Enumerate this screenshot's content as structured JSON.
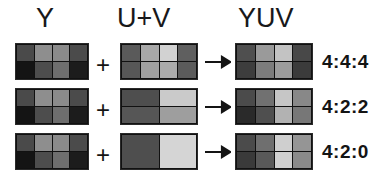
{
  "diagram": {
    "title_columns": {
      "luma": "Y",
      "chroma": "U+V",
      "combined": "YUV"
    },
    "operators": {
      "plus": "+",
      "arrow": "arrow-right-icon"
    },
    "rows": [
      {
        "ratio_label": "4:4:4",
        "luma": {
          "name": "luma-grid",
          "cols": 4,
          "rows": 2,
          "cells": [
            "#4a4a4a",
            "#8e8e8e",
            "#8b8b8b",
            "#4b4b4b",
            "#141414",
            "#4d4d4d",
            "#6e6e6e",
            "#1c1c1c"
          ]
        },
        "chroma": {
          "name": "chroma-grid",
          "cols": 4,
          "rows": 2,
          "cells": [
            "#5a5a5a",
            "#a8a8a8",
            "#d2d2d2",
            "#5f5f5f",
            "#575757",
            "#a0a0a0",
            "#ababab",
            "#5b5b5b"
          ]
        },
        "output": {
          "name": "yuv-grid",
          "cols": 4,
          "rows": 2,
          "cells": [
            "#4f4f4f",
            "#9a9a9a",
            "#c3c3c3",
            "#484848",
            "#3d3d3d",
            "#7c7c7c",
            "#9c9c9c",
            "#3b3b3b"
          ]
        }
      },
      {
        "ratio_label": "4:2:2",
        "luma": {
          "name": "luma-grid",
          "cols": 4,
          "rows": 2,
          "cells": [
            "#4a4a4a",
            "#8e8e8e",
            "#8b8b8b",
            "#4b4b4b",
            "#141414",
            "#4d4d4d",
            "#6e6e6e",
            "#1c1c1c"
          ]
        },
        "chroma": {
          "name": "chroma-grid",
          "cols": 2,
          "rows": 2,
          "cells": [
            "#4e4e4e",
            "#cacaca",
            "#565656",
            "#9e9e9e"
          ]
        },
        "output": {
          "name": "yuv-grid",
          "cols": 4,
          "rows": 2,
          "cells": [
            "#4b4b4b",
            "#717171",
            "#c6c6c6",
            "#888888",
            "#2a2a2a",
            "#4f4f4f",
            "#b2b2b2",
            "#777777"
          ]
        }
      },
      {
        "ratio_label": "4:2:0",
        "luma": {
          "name": "luma-grid",
          "cols": 4,
          "rows": 2,
          "cells": [
            "#4a4a4a",
            "#8e8e8e",
            "#8b8b8b",
            "#4b4b4b",
            "#141414",
            "#4d4d4d",
            "#6e6e6e",
            "#1c1c1c"
          ]
        },
        "chroma": {
          "name": "chroma-grid",
          "cols": 2,
          "rows": 1,
          "cells": [
            "#4e4e4e",
            "#d5d5d5"
          ]
        },
        "output": {
          "name": "yuv-grid",
          "cols": 4,
          "rows": 2,
          "cells": [
            "#4b4b4b",
            "#6f6f6f",
            "#cfcfcf",
            "#959595",
            "#3a3a3a",
            "#595959",
            "#d0d0d0",
            "#8a8a8a"
          ]
        }
      }
    ],
    "colors": {
      "background": "#ffffff",
      "text": "#141414",
      "grid_line": "#111111"
    }
  }
}
